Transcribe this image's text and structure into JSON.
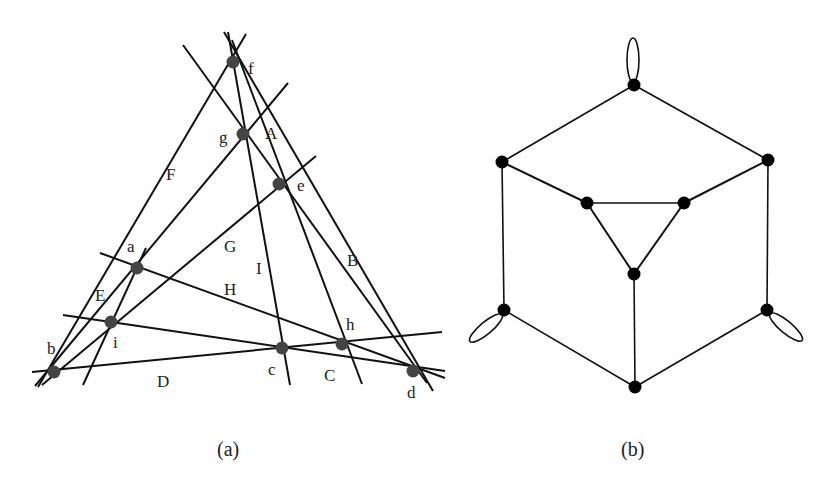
{
  "figure_a": {
    "caption": "(a)",
    "point_labels": {
      "f": "f",
      "g": "g",
      "e": "e",
      "a": "a",
      "i": "i",
      "b": "b",
      "c": "c",
      "h": "h",
      "d": "d"
    },
    "line_labels": {
      "A": "A",
      "B": "B",
      "C": "C",
      "D": "D",
      "E": "E",
      "F": "F",
      "G": "G",
      "H": "H",
      "I": "I"
    },
    "points": [
      {
        "id": "f",
        "x": 233,
        "y": 62
      },
      {
        "id": "g",
        "x": 243,
        "y": 134
      },
      {
        "id": "e",
        "x": 279,
        "y": 184
      },
      {
        "id": "a",
        "x": 137,
        "y": 268
      },
      {
        "id": "i",
        "x": 111,
        "y": 322
      },
      {
        "id": "b",
        "x": 54,
        "y": 372
      },
      {
        "id": "c",
        "x": 282,
        "y": 348
      },
      {
        "id": "h",
        "x": 342,
        "y": 344
      },
      {
        "id": "d",
        "x": 413,
        "y": 371
      }
    ]
  },
  "figure_b": {
    "caption": "(b)",
    "vertices": [
      {
        "id": "top",
        "x": 634,
        "y": 85
      },
      {
        "id": "upper-left",
        "x": 502,
        "y": 162
      },
      {
        "id": "upper-right",
        "x": 768,
        "y": 160
      },
      {
        "id": "inner-left",
        "x": 587,
        "y": 203
      },
      {
        "id": "inner-right",
        "x": 684,
        "y": 203
      },
      {
        "id": "inner-bottom",
        "x": 634,
        "y": 274
      },
      {
        "id": "lower-left",
        "x": 504,
        "y": 310
      },
      {
        "id": "lower-right",
        "x": 767,
        "y": 310
      },
      {
        "id": "bottom",
        "x": 635,
        "y": 387
      }
    ],
    "loops": [
      "top",
      "lower-left",
      "lower-right"
    ]
  }
}
